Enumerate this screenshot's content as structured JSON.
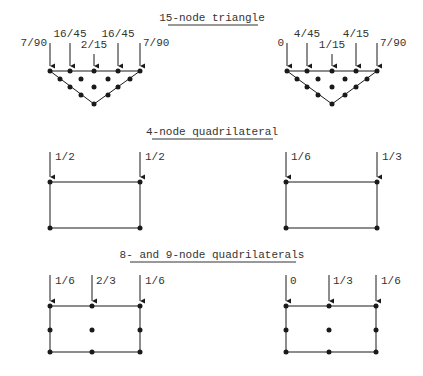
{
  "sections": [
    {
      "title": "15-node triangle",
      "left": {
        "labels": [
          "7/90",
          "16/45",
          "2/15",
          "16/45",
          "7/90"
        ]
      },
      "right": {
        "labels": [
          "0",
          "4/45",
          "1/15",
          "4/15",
          "7/90"
        ]
      }
    },
    {
      "title": "4-node quadrilateral",
      "left": {
        "labels": [
          "1/2",
          "1/2"
        ]
      },
      "right": {
        "labels": [
          "1/6",
          "1/3"
        ]
      }
    },
    {
      "title": "8- and 9-node quadrilaterals",
      "left": {
        "labels": [
          "1/6",
          "2/3",
          "1/6"
        ]
      },
      "right": {
        "labels": [
          "0",
          "1/3",
          "1/6"
        ]
      }
    }
  ],
  "colors": {
    "ink": "#1a1a1a",
    "text": "#333333",
    "background": "#ffffff"
  }
}
